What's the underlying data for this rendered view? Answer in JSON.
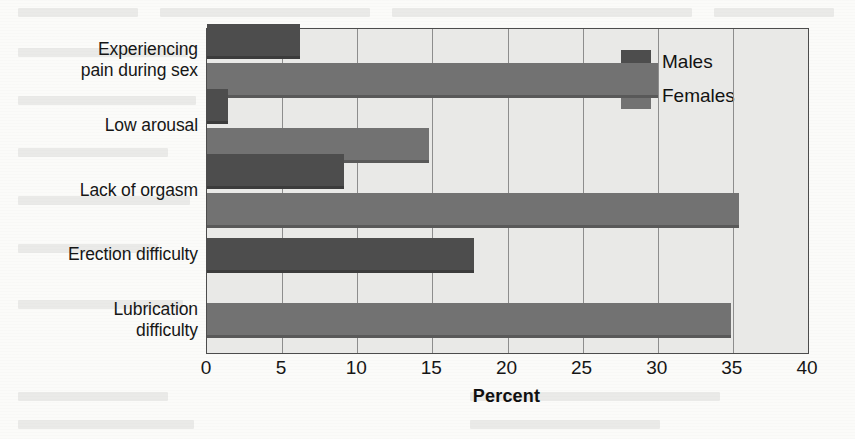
{
  "chart_data": {
    "type": "bar",
    "orientation": "horizontal",
    "title": "",
    "xlabel": "Percent",
    "ylabel": "",
    "xlim": [
      0,
      40
    ],
    "xticks": [
      0,
      5,
      10,
      15,
      20,
      25,
      30,
      35,
      40
    ],
    "grid": true,
    "legend_position": "top-right-inside",
    "categories": [
      "Experiencing\npain during sex",
      "Low arousal",
      "Lack of orgasm",
      "Erection difficulty",
      "Lubrication\ndifficulty"
    ],
    "category_lines": [
      [
        "Experiencing",
        "pain during sex"
      ],
      [
        "Low arousal"
      ],
      [
        "Lack of orgasm"
      ],
      [
        "Erection difficulty"
      ],
      [
        "Lubrication",
        "difficulty"
      ]
    ],
    "series": [
      {
        "name": "Males",
        "color": "#4d4d4d",
        "values": [
          6.2,
          1.4,
          9.1,
          17.8,
          null
        ]
      },
      {
        "name": "Females",
        "color": "#727272",
        "values": [
          30.0,
          14.8,
          35.4,
          null,
          34.9
        ]
      }
    ]
  },
  "legend": {
    "items": [
      {
        "label": "Males",
        "color": "#4d4d4d"
      },
      {
        "label": "Females",
        "color": "#727272"
      }
    ]
  },
  "axis": {
    "x_title": "Percent",
    "tick_labels": [
      "0",
      "5",
      "10",
      "15",
      "20",
      "25",
      "30",
      "35",
      "40"
    ]
  },
  "colors": {
    "plot_background": "#e9e9e7",
    "page_background": "#fbfbf9",
    "frame": "#4c4c4c",
    "gridline": "#8d8d8d",
    "males": "#4d4d4d",
    "females": "#727272",
    "text": "#161616"
  }
}
